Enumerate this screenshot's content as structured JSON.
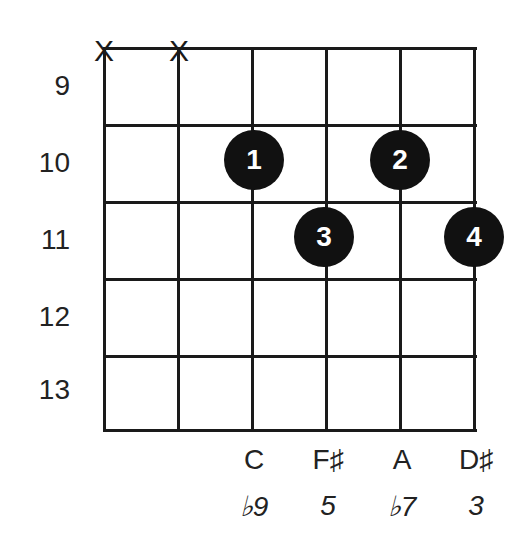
{
  "diagram": {
    "type": "guitar-chord-diagram",
    "strings": 6,
    "frets": [
      9,
      10,
      11,
      12,
      13
    ],
    "muted_strings": [
      1,
      2
    ],
    "mute_symbol": "X",
    "fingers": [
      {
        "string": 3,
        "fret": 10,
        "finger": "1"
      },
      {
        "string": 5,
        "fret": 10,
        "finger": "2"
      },
      {
        "string": 4,
        "fret": 11,
        "finger": "3"
      },
      {
        "string": 6,
        "fret": 11,
        "finger": "4"
      }
    ],
    "notes": [
      {
        "string": 3,
        "note": "C",
        "interval": "♭9"
      },
      {
        "string": 4,
        "note": "F♯",
        "interval": "5"
      },
      {
        "string": 5,
        "note": "A",
        "interval": "♭7"
      },
      {
        "string": 6,
        "note": "D♯",
        "interval": "3"
      }
    ],
    "fret_labels": [
      "9",
      "10",
      "11",
      "12",
      "13"
    ]
  }
}
